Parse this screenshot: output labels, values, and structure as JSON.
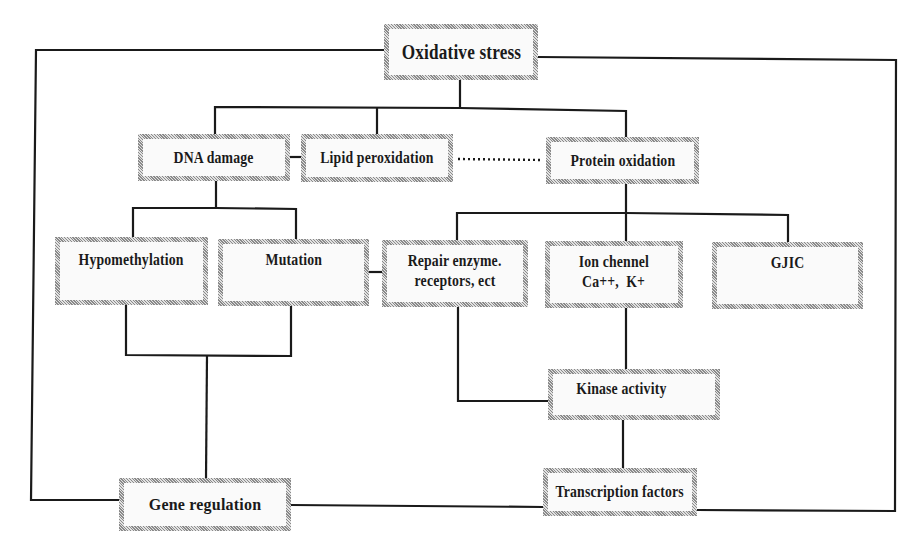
{
  "diagram": {
    "nodes": {
      "oxidative_stress": {
        "label": "Oxidative stress"
      },
      "dna_damage": {
        "label": "DNA damage"
      },
      "lipid_peroxidation": {
        "label": "Lipid peroxidation"
      },
      "protein_oxidation": {
        "label": "Protein oxidation"
      },
      "hypomethylation": {
        "label": "Hypomethylation"
      },
      "mutation": {
        "label": "Mutation"
      },
      "repair_enzyme": {
        "line1": "Repair enzyme.",
        "line2": "receptors, ect"
      },
      "ion_channel": {
        "line1": "Ion chennel",
        "line2": "Ca++,  K+"
      },
      "gjic": {
        "label": "GJIC"
      },
      "kinase_activity": {
        "label": "Kinase activity"
      },
      "gene_regulation": {
        "label": "Gene regulation"
      },
      "transcription_factors": {
        "label": "Transcription factors"
      }
    },
    "edges": [
      {
        "from": "Oxidative stress",
        "to": "DNA damage",
        "style": "solid"
      },
      {
        "from": "Oxidative stress",
        "to": "Lipid peroxidation",
        "style": "solid"
      },
      {
        "from": "Oxidative stress",
        "to": "Protein oxidation",
        "style": "solid"
      },
      {
        "from": "DNA damage",
        "to": "Lipid peroxidation",
        "style": "solid"
      },
      {
        "from": "Lipid peroxidation",
        "to": "Protein oxidation",
        "style": "dotted"
      },
      {
        "from": "DNA damage",
        "to": "Hypomethylation",
        "style": "solid"
      },
      {
        "from": "DNA damage",
        "to": "Mutation",
        "style": "solid"
      },
      {
        "from": "Mutation",
        "to": "Repair enzyme. receptors, ect",
        "style": "solid"
      },
      {
        "from": "Protein oxidation",
        "to": "Repair enzyme. receptors, ect",
        "style": "solid"
      },
      {
        "from": "Protein oxidation",
        "to": "Ion chennel Ca++, K+",
        "style": "solid"
      },
      {
        "from": "Protein oxidation",
        "to": "GJIC",
        "style": "solid"
      },
      {
        "from": "Hypomethylation",
        "to": "Gene regulation",
        "style": "solid"
      },
      {
        "from": "Mutation",
        "to": "Gene regulation",
        "style": "solid"
      },
      {
        "from": "Repair enzyme. receptors, ect",
        "to": "Kinase activity",
        "style": "solid"
      },
      {
        "from": "Ion chennel Ca++, K+",
        "to": "Kinase activity",
        "style": "solid"
      },
      {
        "from": "Kinase activity",
        "to": "Transcription factors",
        "style": "solid"
      },
      {
        "from": "Oxidative stress",
        "to": "Gene regulation",
        "style": "solid",
        "route": "left border"
      },
      {
        "from": "Oxidative stress",
        "to": "Transcription factors",
        "style": "solid",
        "route": "right border"
      },
      {
        "from": "Gene regulation",
        "to": "Transcription factors",
        "style": "solid"
      }
    ],
    "colors": {
      "line": "#1a1a1a",
      "box_fill": "#fafafa",
      "box_border": "#8a8a8a",
      "text": "#1a1a1a"
    }
  }
}
